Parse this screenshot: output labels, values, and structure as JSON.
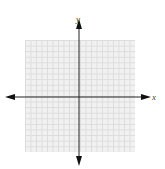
{
  "diagram": {
    "type": "cartesian-coordinate-plane",
    "x_axis_label": "x",
    "y_axis_label": "y",
    "grid": {
      "rows": 20,
      "columns": 20,
      "line_color": "#dcdcdc",
      "fill_color": "#f1f1f1"
    },
    "axis_color": "#222222",
    "arrows": [
      "left",
      "right",
      "up",
      "down"
    ]
  }
}
